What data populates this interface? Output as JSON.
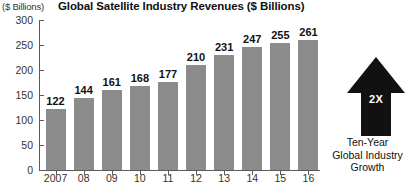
{
  "chart_data": {
    "type": "bar",
    "title": "Global Satellite Industry Revenues ($ Billions)",
    "xlabel": "",
    "ylabel": "($ Billions)",
    "categories": [
      "2007",
      "08",
      "09",
      "10",
      "11",
      "12",
      "13",
      "14",
      "15",
      "16"
    ],
    "values": [
      122,
      144,
      161,
      168,
      177,
      210,
      231,
      247,
      255,
      261
    ],
    "value_labels": [
      "122",
      "144",
      "161",
      "168",
      "177",
      "210",
      "231",
      "247",
      "255",
      "261"
    ],
    "ylim": [
      0,
      300
    ],
    "yticks": [
      0,
      50,
      100,
      150,
      200,
      250,
      300
    ],
    "ytick_labels": [
      "0",
      "50",
      "100",
      "150",
      "200",
      "250",
      "300"
    ],
    "grid": false,
    "legend": "none",
    "bar_color": "#8c8c8c",
    "axis_color": "#5a5a5a",
    "background_color": "#ffffff"
  },
  "annotation": {
    "arrow_label": "2X",
    "arrow_color": "#111111",
    "arrow_label_color": "#ffffff",
    "caption_lines": [
      "Ten-Year",
      "Global Industry",
      "Growth"
    ]
  }
}
